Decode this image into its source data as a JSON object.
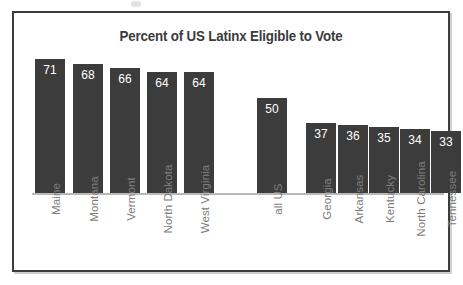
{
  "chart_data": {
    "type": "bar",
    "title": "Percent of US Latinx Eligible to Vote",
    "xlabel": "",
    "ylabel": "",
    "ylim": [
      0,
      75
    ],
    "grid": false,
    "legend": null,
    "orientation": "vertical",
    "value_label_position": "inside-top",
    "tick_label_rotation": 90,
    "categories": [
      "Maine",
      "Montana",
      "Vermont",
      "North Dakota",
      "West Virginia",
      "all US",
      "Georgia",
      "Arkansas",
      "Kentucky",
      "North Carolina",
      "Tennessee"
    ],
    "values": [
      71,
      68,
      66,
      64,
      64,
      50,
      37,
      36,
      35,
      34,
      33
    ],
    "bars": [
      {
        "category": "Maine",
        "value": 71,
        "label": "71",
        "group": "high-states"
      },
      {
        "category": "Montana",
        "value": 68,
        "label": "68",
        "group": "high-states"
      },
      {
        "category": "Vermont",
        "value": 66,
        "label": "66",
        "group": "high-states"
      },
      {
        "category": "North Dakota",
        "value": 64,
        "label": "64",
        "group": "high-states"
      },
      {
        "category": "West Virginia",
        "value": 64,
        "label": "64",
        "group": "high-states"
      },
      {
        "category": "all US",
        "value": 50,
        "label": "50",
        "group": "national"
      },
      {
        "category": "Georgia",
        "value": 37,
        "label": "37",
        "group": "low-states"
      },
      {
        "category": "Arkansas",
        "value": 36,
        "label": "36",
        "group": "low-states"
      },
      {
        "category": "Kentucky",
        "value": 35,
        "label": "35",
        "group": "low-states"
      },
      {
        "category": "North Carolina",
        "value": 34,
        "label": "34",
        "group": "low-states"
      },
      {
        "category": "Tennessee",
        "value": 33,
        "label": "33",
        "group": "low-states"
      }
    ],
    "colors": {
      "bar_fill": "#3c3c3c",
      "value_text": "#ffffff",
      "tick_label": "#7d7d7d",
      "title": "#3b3b3b",
      "baseline": "#b9b9b9",
      "frame_border": "#3c3c3c",
      "background": "#ffffff"
    }
  }
}
